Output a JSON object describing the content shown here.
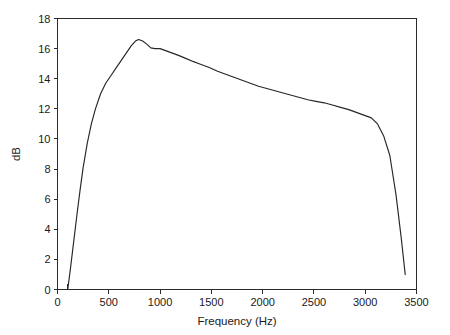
{
  "chart_data": {
    "type": "line",
    "title": "",
    "xlabel": "Frequency (Hz)",
    "ylabel": "dB",
    "xlim": [
      0,
      3500
    ],
    "ylim": [
      0,
      18
    ],
    "grid": false,
    "legend": null,
    "xticks": [
      0,
      500,
      1000,
      1500,
      2000,
      2500,
      3000,
      3500
    ],
    "xtick_labels": [
      "0",
      "500",
      "1000",
      "1500",
      "2000",
      "2500",
      "3000",
      "3500"
    ],
    "yticks": [
      0,
      2,
      4,
      6,
      8,
      10,
      12,
      14,
      16,
      18
    ],
    "ytick_labels": [
      "0",
      "2",
      "4",
      "6",
      "8",
      "10",
      "12",
      "14",
      "16",
      "18"
    ],
    "series": [
      {
        "name": "response",
        "color": "#262626",
        "x": [
          100,
          130,
          160,
          190,
          220,
          250,
          290,
          330,
          370,
          420,
          470,
          520,
          570,
          620,
          670,
          720,
          760,
          790,
          830,
          870,
          910,
          950,
          1000,
          1060,
          1120,
          1180,
          1250,
          1320,
          1400,
          1480,
          1560,
          1640,
          1720,
          1800,
          1880,
          1960,
          2040,
          2120,
          2200,
          2280,
          2360,
          2440,
          2520,
          2600,
          2680,
          2760,
          2840,
          2920,
          3000,
          3060,
          3120,
          3180,
          3240,
          3300,
          3350,
          3390
        ],
        "y": [
          0.0,
          1.6,
          3.3,
          5.0,
          6.6,
          8.1,
          9.7,
          11.0,
          12.0,
          13.0,
          13.7,
          14.2,
          14.7,
          15.2,
          15.7,
          16.2,
          16.5,
          16.6,
          16.5,
          16.3,
          16.05,
          16.0,
          16.0,
          15.85,
          15.7,
          15.55,
          15.35,
          15.15,
          14.95,
          14.75,
          14.5,
          14.3,
          14.1,
          13.9,
          13.7,
          13.5,
          13.35,
          13.2,
          13.05,
          12.9,
          12.75,
          12.6,
          12.5,
          12.4,
          12.25,
          12.1,
          11.95,
          11.75,
          11.55,
          11.4,
          11.0,
          10.2,
          8.9,
          6.3,
          3.5,
          1.0
        ]
      }
    ],
    "annotations": []
  },
  "axes": {
    "x_axis_label": "Frequency (Hz)",
    "y_axis_label": "dB"
  }
}
